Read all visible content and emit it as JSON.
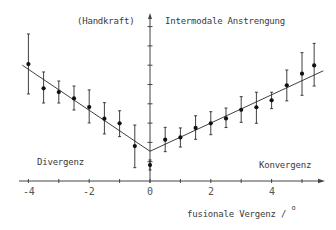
{
  "chart_data": {
    "type": "scatter",
    "title": "",
    "xlabel": "fusionale Vergenz / °",
    "ylabel": "Intermodale Anstrengung",
    "ylabel_note": "(Handkraft)",
    "annotations": [
      {
        "text": "Divergenz",
        "position": "lower-left"
      },
      {
        "text": "Konvergenz",
        "position": "lower-right"
      }
    ],
    "x_ticks": [
      -4,
      -2,
      0,
      2,
      4
    ],
    "x_minor_ticks": [
      -4,
      -3,
      -2,
      -1,
      0,
      1,
      2,
      3,
      4,
      5
    ],
    "xlim": [
      -4.3,
      5.7
    ],
    "ylim": [
      0,
      8.5
    ],
    "y_ticks_unlabeled": [
      1,
      2,
      3,
      4,
      5,
      6,
      7,
      8
    ],
    "grid": false,
    "legend": null,
    "series": [
      {
        "name": "Messwerte (Mittelwert ± Streuung)",
        "x": [
          -4,
          -3.5,
          -3,
          -2.5,
          -2,
          -1.5,
          -1,
          -0.5,
          0,
          0.5,
          1,
          1.5,
          2,
          2.5,
          3,
          3.5,
          4,
          4.5,
          5,
          5.4
        ],
        "y": [
          6.06,
          4.8,
          4.61,
          4.28,
          3.83,
          3.23,
          2.99,
          1.81,
          0.83,
          2.14,
          2.26,
          2.75,
          2.99,
          3.24,
          3.69,
          3.82,
          4.18,
          4.96,
          5.56,
          5.99
        ],
        "y_upper": [
          7.62,
          5.65,
          5.18,
          4.92,
          4.72,
          4.06,
          3.64,
          2.9,
          1.09,
          2.78,
          2.75,
          3.38,
          3.59,
          3.78,
          4.37,
          4.6,
          4.6,
          5.75,
          6.65,
          7.13
        ],
        "y_lower": [
          4.51,
          4.04,
          4.04,
          3.68,
          3.01,
          2.44,
          2.3,
          0.69,
          0.57,
          1.52,
          1.76,
          2.16,
          2.4,
          2.77,
          3.04,
          2.99,
          3.75,
          4.15,
          4.44,
          4.92
        ]
      }
    ],
    "fit_lines": [
      {
        "name": "Regression Divergenz",
        "x": [
          -4.2,
          0
        ],
        "y": [
          6.0,
          1.54
        ]
      },
      {
        "name": "Regression Konvergenz",
        "x": [
          0,
          5.7
        ],
        "y": [
          1.54,
          5.71
        ]
      }
    ]
  },
  "labels": {
    "handkraft": "(Handkraft)",
    "y_axis_title": "Intermodale Anstrengung",
    "divergenz": "Divergenz",
    "konvergenz": "Konvergenz",
    "x_axis_title": "fusionale Vergenz /",
    "x_axis_unit": "o",
    "tick_m4": "-4",
    "tick_m2": "-2",
    "tick_0": "0",
    "tick_2": "2",
    "tick_4": "4"
  },
  "colors": {
    "ink": "#2a2a2a",
    "axis": "#444444",
    "background": "#ffffff"
  }
}
